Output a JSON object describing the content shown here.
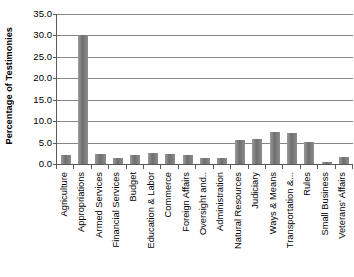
{
  "chart_data": {
    "type": "bar",
    "title": "",
    "xlabel": "",
    "ylabel": "Percentage of Testimonies",
    "ylim": [
      0,
      35
    ],
    "ytick_step": 5,
    "grid": true,
    "legend": false,
    "bar_color": "#808080",
    "gridline_color": "#868686",
    "axis_color": "#5a5a5a",
    "yticks": [
      "0.0",
      "5.0",
      "10.0",
      "15.0",
      "20.0",
      "25.0",
      "30.0",
      "35.0"
    ],
    "categories": [
      "Agriculture",
      "Appropriations",
      "Armed Services",
      "Financial Services",
      "Budget",
      "Education & Labor",
      "Commerce",
      "Foreign Affairs",
      "Oversight and..",
      "Administration",
      "Natural Resources",
      "Judiciary",
      "Ways & Means",
      "Transportation &...",
      "Rules",
      "Small Business",
      "Veterans' Affairs"
    ],
    "values": [
      2.2,
      30.2,
      2.4,
      1.3,
      2.0,
      2.5,
      2.3,
      2.2,
      1.3,
      1.5,
      5.5,
      5.8,
      7.5,
      7.3,
      5.1,
      0.4,
      1.6
    ]
  }
}
